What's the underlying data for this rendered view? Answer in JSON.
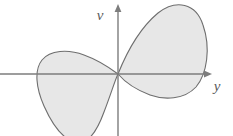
{
  "figure": {
    "background_color": "#ffffff",
    "width": 233,
    "height": 136,
    "axes": {
      "color": "#7d7d7d",
      "line_width": 1.4,
      "origin": {
        "x": 118,
        "y": 74
      },
      "horizontal": {
        "name": "y-axis",
        "label": "y",
        "label_x": 217,
        "label_y": 91,
        "start_x": 0,
        "end_x": 212,
        "y": 74,
        "arrow": "right"
      },
      "vertical": {
        "name": "v-axis",
        "label": "v",
        "label_x": 100,
        "label_y": 20,
        "x": 118,
        "start_y": 136,
        "end_y": 4,
        "arrow": "up"
      }
    },
    "region": {
      "name": "shaded-region",
      "fill_color": "#e7e7e7",
      "stroke_color": "#6e6e6e",
      "stroke_width": 1.1,
      "description": "Two-lobed closed curve resembling a lemniscate, crossing itself at the origin",
      "lobes": [
        {
          "name": "right-lobe",
          "quadrant": "upper-right",
          "extent_top_y": 5,
          "extent_right_x": 206,
          "extent_bottom_y": 97,
          "path": "M 118 74 C 126 54, 140 28, 158 13 C 176 -1, 196 3, 203 25 C 211 48, 207 74, 196 87 C 184 100, 164 100, 150 95 C 134 89, 124 81, 118 74 Z"
        },
        {
          "name": "left-lobe",
          "quadrant": "lower-left",
          "extent_top_y": 53,
          "extent_left_x": 38,
          "extent_bottom_y": 140,
          "path": "M 118 74 C 110 68, 98 60, 84 55 C 68 49, 50 50, 42 60 C 34 70, 36 88, 44 106 C 52 124, 62 138, 74 142 C 86 146, 96 134, 104 112 C 111 94, 115 80, 118 74 Z"
        }
      ]
    }
  },
  "chart_data": {
    "type": "line",
    "xlabel": "y",
    "ylabel": "v",
    "grid": false,
    "legend": null,
    "annotations": [
      "Curve is a closed, self-intersecting loop (figure-eight) passing through the origin",
      "Upper-right lobe is larger than the lower-left lobe",
      "Interior of both lobes is shaded light gray",
      "Lower-left lobe is clipped by the bottom edge of the figure"
    ],
    "series": [
      {
        "name": "right-lobe",
        "closed": true,
        "x": [
          0,
          0.35,
          0.85,
          1.55,
          2.45,
          3.3,
          3.9,
          4.05,
          3.75,
          3.05,
          2.15,
          1.25,
          0.55,
          0
        ],
        "y": [
          0,
          0.95,
          1.9,
          2.75,
          3.3,
          3.2,
          2.35,
          1.25,
          0.25,
          -0.5,
          -1.0,
          -1.0,
          -0.6,
          0
        ]
      },
      {
        "name": "left-lobe",
        "closed": true,
        "x": [
          0,
          -0.45,
          -1.1,
          -1.85,
          -2.55,
          -3.1,
          -3.35,
          -3.15,
          -2.65,
          -2.0,
          -1.4,
          -0.85,
          -0.35,
          0
        ],
        "y": [
          0,
          0.35,
          0.75,
          0.95,
          0.95,
          0.6,
          -0.1,
          -1.1,
          -2.1,
          -2.95,
          -3.35,
          -3.0,
          -1.75,
          0
        ]
      }
    ],
    "xlim": [
      -5.9,
      4.7
    ],
    "ylim": [
      -3.6,
      3.5
    ]
  }
}
